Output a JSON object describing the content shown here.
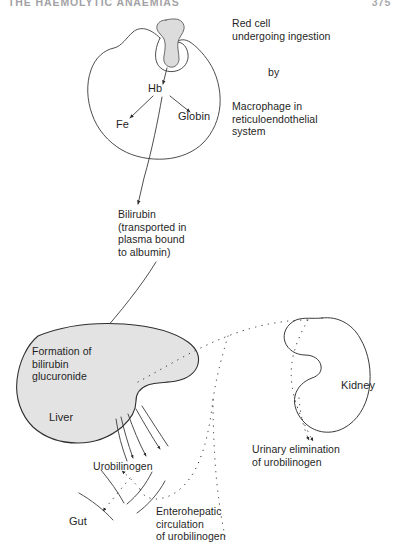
{
  "page": {
    "running_head": "THE HAEMOLYTIC ANAEMIAS",
    "folio": "375"
  },
  "figure": {
    "colors": {
      "ink": "#1f1f1f",
      "stroke": "#3a3a3a",
      "liver_fill": "#e3e3e3",
      "red_cell_fill": "#dcdcdc",
      "page_background": "#ffffff"
    },
    "labels": {
      "red_cell": "Red cell\nundergoing ingestion",
      "by": "by",
      "macrophage": "Macrophage in\nreticuloendothelial\nsystem",
      "hb": "Hb",
      "fe": "Fe",
      "globin": "Globin",
      "bilirubin": "Bilirubin\n(transported in\nplasma bound\nto albumin)",
      "formation": "Formation of\nbilirubin\nglucuronide",
      "liver": "Liver",
      "kidney": "Kidney",
      "urinary_elimination": "Urinary elimination\nof urobilinogen",
      "urobilinogen": "Urobilinogen",
      "gut": "Gut",
      "enterohepatic": "Enterohepatic\ncirculation\nof urobilinogen"
    },
    "organs": [
      {
        "name": "macrophage",
        "label": "Macrophage in reticuloendothelial system",
        "filled": false
      },
      {
        "name": "red-cell",
        "label": "Red cell undergoing ingestion",
        "filled": true
      },
      {
        "name": "liver",
        "label": "Liver",
        "filled": true
      },
      {
        "name": "kidney",
        "label": "Kidney",
        "filled": false
      },
      {
        "name": "gut",
        "label": "Gut",
        "filled": false
      }
    ],
    "flow_steps": [
      {
        "from": "Red cell",
        "to": "Hb",
        "style": "solid-arrow"
      },
      {
        "from": "Hb",
        "to": "Fe",
        "style": "solid-arrow"
      },
      {
        "from": "Hb",
        "to": "Globin",
        "style": "solid-arrow"
      },
      {
        "from": "Hb",
        "to": "Bilirubin",
        "style": "solid-arrow"
      },
      {
        "from": "Bilirubin",
        "to": "Formation of bilirubin glucuronide",
        "style": "solid-arrow"
      },
      {
        "from": "Liver",
        "to": "Urobilinogen",
        "style": "solid-arrow"
      },
      {
        "from": "Urobilinogen",
        "to": "Gut",
        "style": "dotted-arrow"
      },
      {
        "from": "Gut",
        "to": "Liver",
        "style": "dotted-arrow"
      },
      {
        "from": "Enterohepatic circulation",
        "to": "Kidney",
        "style": "dotted-arrow"
      },
      {
        "from": "Kidney",
        "to": "Urinary elimination of urobilinogen",
        "style": "dotted-arrow"
      }
    ]
  }
}
